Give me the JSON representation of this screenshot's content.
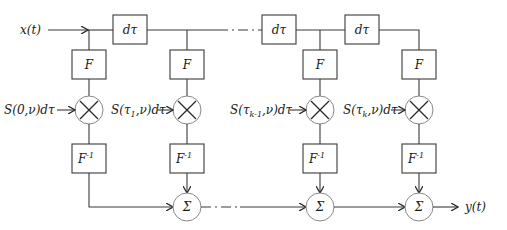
{
  "diagram": {
    "input_label": "x(t)",
    "output_label": "y(t)",
    "delay_label": "dτ",
    "forward_transform_label": "F",
    "inverse_transform_label": "F",
    "inverse_superscript": "-1",
    "sum_label": "Σ",
    "delays": [
      {
        "label": "dτ"
      },
      {
        "label": "dτ"
      },
      {
        "label": "dτ"
      }
    ],
    "branches": [
      {
        "weight_main": "S(0,ν)dτ",
        "weight_parts": [
          "S(0,ν)dτ"
        ]
      },
      {
        "weight_prefix": "S(τ",
        "weight_sub": "1",
        "weight_suffix": ",ν)dτ"
      },
      {
        "weight_prefix": "S(τ",
        "weight_sub": "k-1",
        "weight_suffix": ",ν)dτ"
      },
      {
        "weight_prefix": "S(τ",
        "weight_sub": "k",
        "weight_suffix": ",ν)dτ"
      }
    ]
  }
}
